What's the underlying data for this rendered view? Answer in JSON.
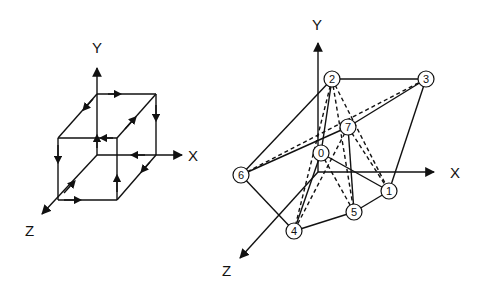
{
  "left_figure": {
    "name": "cube-with-directed-edges",
    "axes": {
      "x_label": "X",
      "y_label": "Y",
      "z_label": "Z"
    }
  },
  "right_figure": {
    "name": "vertex-graph",
    "axes": {
      "x_label": "X",
      "y_label": "Y",
      "z_label": "Z"
    },
    "nodes": [
      "0",
      "1",
      "2",
      "3",
      "4",
      "5",
      "6",
      "7"
    ],
    "solid_edges": [
      [
        "2",
        "3"
      ],
      [
        "3",
        "1"
      ],
      [
        "2",
        "6"
      ],
      [
        "6",
        "4"
      ],
      [
        "4",
        "5"
      ],
      [
        "5",
        "1"
      ],
      [
        "0",
        "1"
      ],
      [
        "6",
        "7"
      ],
      [
        "7",
        "3"
      ],
      [
        "7",
        "5"
      ],
      [
        "0",
        "4"
      ],
      [
        "2",
        "0"
      ]
    ],
    "dashed_edges": [
      [
        "2",
        "1"
      ],
      [
        "2",
        "5"
      ],
      [
        "7",
        "4"
      ],
      [
        "7",
        "1"
      ],
      [
        "6",
        "3"
      ],
      [
        "2",
        "4"
      ],
      [
        "0",
        "5"
      ]
    ]
  }
}
